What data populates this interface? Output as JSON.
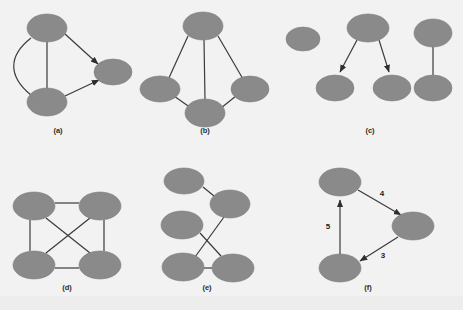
{
  "figure": {
    "width": 463,
    "height": 310,
    "background_color": "#f2f2f2",
    "node_fill_color": "#8a8a8a",
    "node_stroke_color": "#7a7a7a",
    "edge_color": "#3a3a3a",
    "label_color": "#2b2b2b"
  },
  "captions": {
    "a": "(a)",
    "b": "(b)",
    "c": "(c)",
    "d": "(d)",
    "e": "(e)",
    "f": "(f)"
  },
  "panels": [
    {
      "id": "a",
      "caption": "(a)",
      "kind": "directed-multigraph",
      "node_count": 3,
      "edge_count": 4,
      "nodes": [
        {
          "id": "a1",
          "cx": 47,
          "cy": 28,
          "rx": 20,
          "ry": 14
        },
        {
          "id": "a2",
          "cx": 47,
          "cy": 102,
          "rx": 20,
          "ry": 14
        },
        {
          "id": "a3",
          "cx": 113,
          "cy": 72,
          "rx": 19,
          "ry": 13
        }
      ],
      "edges": [
        {
          "from": "a1",
          "to": "a2",
          "style": "curved",
          "directed": false
        },
        {
          "from": "a1",
          "to": "a2",
          "style": "straight",
          "directed": false
        },
        {
          "from": "a1",
          "to": "a3",
          "style": "straight",
          "directed": true
        },
        {
          "from": "a2",
          "to": "a3",
          "style": "straight",
          "directed": true
        }
      ]
    },
    {
      "id": "b",
      "caption": "(b)",
      "kind": "undirected-graph",
      "node_count": 4,
      "edge_count": 5,
      "nodes": [
        {
          "id": "b1",
          "cx": 203,
          "cy": 26,
          "rx": 20,
          "ry": 14
        },
        {
          "id": "b2",
          "cx": 160,
          "cy": 89,
          "rx": 20,
          "ry": 13
        },
        {
          "id": "b3",
          "cx": 250,
          "cy": 89,
          "rx": 19,
          "ry": 13
        },
        {
          "id": "b4",
          "cx": 205,
          "cy": 113,
          "rx": 20,
          "ry": 14
        }
      ],
      "edges": [
        {
          "from": "b1",
          "to": "b2",
          "style": "straight",
          "directed": false
        },
        {
          "from": "b1",
          "to": "b3",
          "style": "straight",
          "directed": false
        },
        {
          "from": "b1",
          "to": "b4",
          "style": "straight",
          "directed": false
        },
        {
          "from": "b2",
          "to": "b4",
          "style": "straight",
          "directed": false
        },
        {
          "from": "b3",
          "to": "b4",
          "style": "straight",
          "directed": false
        }
      ]
    },
    {
      "id": "c",
      "caption": "(c)",
      "kind": "disconnected-forest",
      "node_count": 6,
      "edge_count": 3,
      "nodes": [
        {
          "id": "c1",
          "cx": 303,
          "cy": 39,
          "rx": 17,
          "ry": 12
        },
        {
          "id": "c2",
          "cx": 368,
          "cy": 28,
          "rx": 21,
          "ry": 14
        },
        {
          "id": "c3",
          "cx": 335,
          "cy": 88,
          "rx": 19,
          "ry": 13
        },
        {
          "id": "c4",
          "cx": 392,
          "cy": 88,
          "rx": 19,
          "ry": 13
        },
        {
          "id": "c5",
          "cx": 433,
          "cy": 33,
          "rx": 19,
          "ry": 14
        },
        {
          "id": "c6",
          "cx": 433,
          "cy": 88,
          "rx": 19,
          "ry": 13
        }
      ],
      "edges": [
        {
          "from": "c2",
          "to": "c3",
          "style": "straight",
          "directed": true
        },
        {
          "from": "c2",
          "to": "c4",
          "style": "straight",
          "directed": true
        },
        {
          "from": "c5",
          "to": "c6",
          "style": "straight",
          "directed": false
        }
      ]
    },
    {
      "id": "d",
      "caption": "(d)",
      "kind": "complete-graph-K4",
      "node_count": 4,
      "edge_count": 6,
      "nodes": [
        {
          "id": "d1",
          "cx": 34,
          "cy": 206,
          "rx": 21,
          "ry": 14
        },
        {
          "id": "d2",
          "cx": 100,
          "cy": 206,
          "rx": 21,
          "ry": 14
        },
        {
          "id": "d3",
          "cx": 34,
          "cy": 265,
          "rx": 21,
          "ry": 14
        },
        {
          "id": "d4",
          "cx": 100,
          "cy": 265,
          "rx": 21,
          "ry": 14
        }
      ],
      "edges": [
        {
          "from": "d1",
          "to": "d2",
          "style": "straight",
          "directed": false
        },
        {
          "from": "d1",
          "to": "d3",
          "style": "straight",
          "directed": false
        },
        {
          "from": "d2",
          "to": "d4",
          "style": "straight",
          "directed": false
        },
        {
          "from": "d3",
          "to": "d4",
          "style": "straight",
          "directed": false
        },
        {
          "from": "d1",
          "to": "d4",
          "style": "straight",
          "directed": false
        },
        {
          "from": "d2",
          "to": "d3",
          "style": "straight",
          "directed": false
        }
      ]
    },
    {
      "id": "e",
      "caption": "(e)",
      "kind": "undirected-graph-with-crossings",
      "node_count": 5,
      "edge_count": 4,
      "nodes": [
        {
          "id": "e1",
          "cx": 184,
          "cy": 181,
          "rx": 20,
          "ry": 13
        },
        {
          "id": "e2",
          "cx": 230,
          "cy": 204,
          "rx": 20,
          "ry": 14
        },
        {
          "id": "e3",
          "cx": 182,
          "cy": 225,
          "rx": 21,
          "ry": 14
        },
        {
          "id": "e4",
          "cx": 183,
          "cy": 267,
          "rx": 21,
          "ry": 14
        },
        {
          "id": "e5",
          "cx": 233,
          "cy": 268,
          "rx": 21,
          "ry": 14
        }
      ],
      "edges": [
        {
          "from": "e1",
          "to": "e2",
          "style": "straight",
          "directed": false
        },
        {
          "from": "e3",
          "to": "e5",
          "style": "straight",
          "directed": false
        },
        {
          "from": "e2",
          "to": "e4",
          "style": "straight",
          "directed": false
        },
        {
          "from": "e4",
          "to": "e5",
          "style": "straight",
          "directed": false
        }
      ]
    },
    {
      "id": "f",
      "caption": "(f)",
      "kind": "weighted-directed-cycle",
      "node_count": 3,
      "edge_count": 3,
      "nodes": [
        {
          "id": "f1",
          "cx": 340,
          "cy": 182,
          "rx": 21,
          "ry": 14
        },
        {
          "id": "f2",
          "cx": 413,
          "cy": 226,
          "rx": 21,
          "ry": 14
        },
        {
          "id": "f3",
          "cx": 340,
          "cy": 268,
          "rx": 21,
          "ry": 14
        }
      ],
      "edges": [
        {
          "from": "f1",
          "to": "f2",
          "style": "straight",
          "directed": true,
          "weight": "4",
          "label_x": 382,
          "label_y": 196
        },
        {
          "from": "f2",
          "to": "f3",
          "style": "straight",
          "directed": true,
          "weight": "3",
          "label_x": 381,
          "label_y": 256
        },
        {
          "from": "f3",
          "to": "f1",
          "style": "straight",
          "directed": true,
          "weight": "5",
          "label_x": 327,
          "label_y": 226
        }
      ]
    }
  ],
  "weights": {
    "top_to_right": "4",
    "right_to_bottom": "3",
    "bottom_to_top": "5"
  }
}
